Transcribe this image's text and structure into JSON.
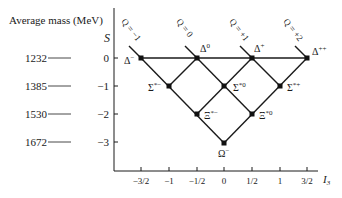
{
  "title": "Average mass (MeV)",
  "y_axis": {
    "label": "S",
    "ticks": [
      {
        "value": "0",
        "mass": "1232"
      },
      {
        "value": "−1",
        "mass": "1385"
      },
      {
        "value": "−2",
        "mass": "1530"
      },
      {
        "value": "−3",
        "mass": "1672"
      }
    ]
  },
  "x_axis": {
    "label": "I",
    "label_sub": "3",
    "ticks": [
      "−3/2",
      "−1",
      "−1/2",
      "0",
      "1/2",
      "1",
      "3/2"
    ]
  },
  "charge_lines": [
    "Q = −1",
    "Q = 0",
    "Q = +1",
    "Q = +2"
  ],
  "particles": [
    {
      "name": "Δ−",
      "base": "Δ",
      "sup": "−",
      "I3": -1.5,
      "S": 0
    },
    {
      "name": "Δ0",
      "base": "Δ",
      "sup": "0",
      "I3": -0.5,
      "S": 0
    },
    {
      "name": "Δ+",
      "base": "Δ",
      "sup": "+",
      "I3": 0.5,
      "S": 0
    },
    {
      "name": "Δ++",
      "base": "Δ",
      "sup": "++",
      "I3": 1.5,
      "S": 0
    },
    {
      "name": "Σ*−",
      "base": "Σ",
      "sup": "*−",
      "I3": -1,
      "S": -1
    },
    {
      "name": "Σ*0",
      "base": "Σ",
      "sup": "*0",
      "I3": 0,
      "S": -1
    },
    {
      "name": "Σ*+",
      "base": "Σ",
      "sup": "*+",
      "I3": 1,
      "S": -1
    },
    {
      "name": "Ξ*−",
      "base": "Ξ",
      "sup": "*−",
      "I3": -0.5,
      "S": -2
    },
    {
      "name": "Ξ*0",
      "base": "Ξ",
      "sup": "*0",
      "I3": 0.5,
      "S": -2
    },
    {
      "name": "Ω−",
      "base": "Ω",
      "sup": "−",
      "I3": 0,
      "S": -3
    }
  ]
}
